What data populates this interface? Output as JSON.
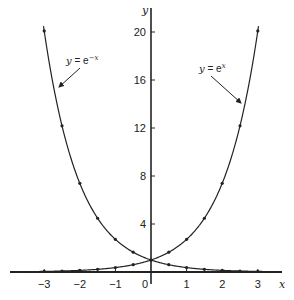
{
  "chart_data": {
    "type": "line",
    "title": "",
    "xlabel": "x",
    "ylabel": "y",
    "xlim": [
      -3.1,
      3.6
    ],
    "ylim": [
      0,
      21.5
    ],
    "grid": false,
    "legend": "none (inline annotations with arrows)",
    "x_ticks": [
      -3,
      -2,
      -1,
      0,
      1,
      2,
      3
    ],
    "x_tick_labels": [
      "−3",
      "−2",
      "−1",
      "0",
      "1",
      "2",
      "3"
    ],
    "y_ticks": [
      4,
      8,
      12,
      16,
      20
    ],
    "y_tick_labels": [
      "4",
      "8",
      "12",
      "16",
      "20"
    ],
    "series": [
      {
        "name": "y = e^-x",
        "label_prefix": "y",
        "label_eq": " = e",
        "label_exp": "−x",
        "x": [
          -3,
          -2.5,
          -2,
          -1.5,
          -1,
          -0.5,
          0,
          0.5,
          1,
          1.5,
          2,
          2.5,
          3
        ],
        "values": [
          20.09,
          12.18,
          7.39,
          4.48,
          2.72,
          1.65,
          1.0,
          0.61,
          0.37,
          0.22,
          0.14,
          0.08,
          0.05
        ]
      },
      {
        "name": "y = e^x",
        "label_prefix": "y",
        "label_eq": " = e",
        "label_exp": "x",
        "x": [
          -3,
          -2.5,
          -2,
          -1.5,
          -1,
          -0.5,
          0,
          0.5,
          1,
          1.5,
          2,
          2.5,
          3
        ],
        "values": [
          0.05,
          0.08,
          0.14,
          0.22,
          0.37,
          0.61,
          1.0,
          1.65,
          2.72,
          4.48,
          7.39,
          12.18,
          20.09
        ]
      }
    ],
    "annotations": [
      {
        "text": "y = e^−x",
        "points_to_series": "y = e^-x",
        "position": "upper-left"
      },
      {
        "text": "y = e^x",
        "points_to_series": "y = e^x",
        "position": "upper-right"
      }
    ]
  }
}
